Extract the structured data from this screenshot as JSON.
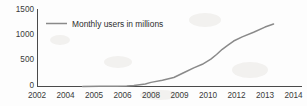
{
  "chart_data": {
    "type": "line",
    "title": "",
    "subtitle": "",
    "xlabel": "",
    "ylabel": "",
    "xlim": [
      2002,
      2014
    ],
    "ylim": [
      0,
      1500
    ],
    "grid": false,
    "legend_position": "top-left",
    "legend": [
      "Monthly users in millions"
    ],
    "ytick_labels": [
      "0",
      "500",
      "1000",
      "1500"
    ],
    "ytick_values": [
      0,
      500,
      1000,
      1500
    ],
    "xtick_labels": [
      "2002",
      "2004",
      "2005",
      "2006",
      "2008",
      "2009",
      "2010",
      "2012",
      "2013",
      "2014"
    ],
    "xtick_values": [
      2002,
      2004,
      2005,
      2006,
      2008,
      2009,
      2010,
      2012,
      2013,
      2014
    ],
    "series": [
      {
        "name": "Monthly users in millions",
        "color": "#8a8a8a",
        "x": [
          2004.6,
          2005.2,
          2005.8,
          2006.3,
          2006.8,
          2007.2,
          2007.6,
          2008.0,
          2008.4,
          2008.8,
          2009.2,
          2009.5,
          2009.8,
          2010.2,
          2010.6,
          2011.0,
          2011.4,
          2011.8,
          2012.2,
          2012.6,
          2013.0,
          2013.3
        ],
        "y": [
          1,
          3,
          6,
          12,
          20,
          34,
          50,
          80,
          120,
          175,
          280,
          360,
          430,
          530,
          620,
          720,
          800,
          880,
          960,
          1050,
          1150,
          1210
        ]
      }
    ]
  },
  "axes": {
    "y_axis_name": "monthly-users-millions",
    "x_axis_name": "year"
  }
}
